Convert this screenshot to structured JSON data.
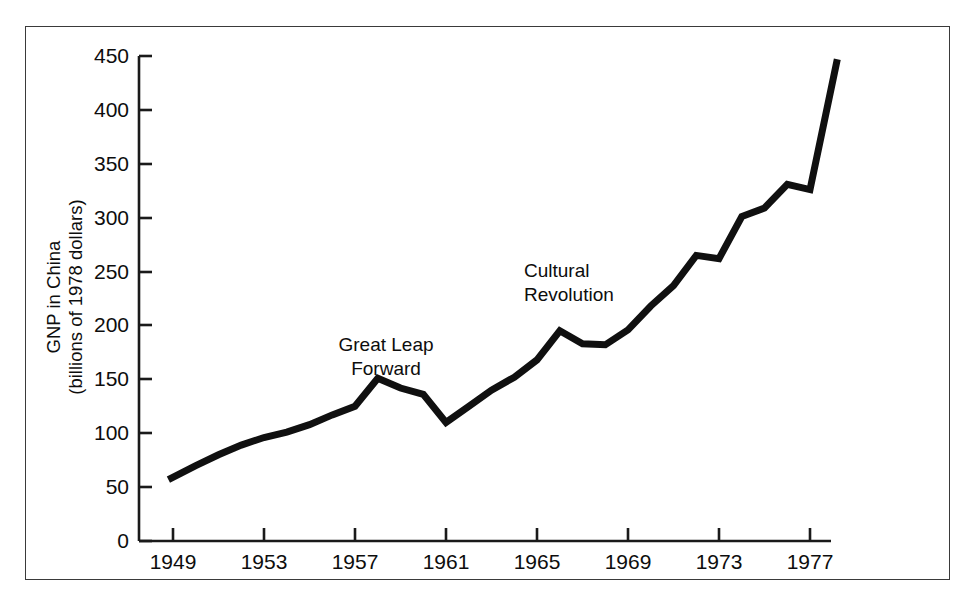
{
  "chart_data": {
    "type": "line",
    "title": "",
    "xlabel": "",
    "ylabel": "GNP in China\n(billions of 1978 dollars)",
    "ylabel_line1": "GNP in China",
    "ylabel_line2": "(billions of 1978 dollars)",
    "xlim": [
      1948.3,
      1978.6
    ],
    "ylim": [
      0,
      460
    ],
    "grid": false,
    "legend": false,
    "line_color": "#101010",
    "line_width_px": 7,
    "x_ticks": [
      1949,
      1953,
      1957,
      1961,
      1965,
      1969,
      1973,
      1977
    ],
    "x_tick_labels": [
      "1949",
      "1953",
      "1957",
      "1961",
      "1965",
      "1969",
      "1973",
      "1977"
    ],
    "y_ticks": [
      0,
      50,
      100,
      150,
      200,
      250,
      300,
      350,
      400,
      450
    ],
    "y_tick_labels": [
      "0",
      "50",
      "100",
      "150",
      "200",
      "250",
      "300",
      "350",
      "400",
      "450"
    ],
    "x": [
      1948.8,
      1950,
      1951,
      1952,
      1953,
      1954,
      1955,
      1956,
      1957,
      1958,
      1959,
      1960,
      1961,
      1962,
      1963,
      1964,
      1965,
      1966,
      1967,
      1968,
      1969,
      1970,
      1971,
      1972,
      1973,
      1974,
      1975,
      1976,
      1977,
      1978.2
    ],
    "values": [
      57,
      70,
      80,
      89,
      96,
      101,
      108,
      117,
      125,
      151,
      142,
      136,
      110,
      125,
      140,
      152,
      168,
      195,
      183,
      182,
      196,
      218,
      237,
      265,
      262,
      301,
      309,
      331,
      326,
      447
    ],
    "series": [
      {
        "name": "GNP in China",
        "values": [
          57,
          70,
          80,
          89,
          96,
          101,
          108,
          117,
          125,
          151,
          142,
          136,
          110,
          125,
          140,
          152,
          168,
          195,
          183,
          182,
          196,
          218,
          237,
          265,
          262,
          301,
          309,
          331,
          326,
          447
        ]
      }
    ],
    "annotations": [
      {
        "id": "great-leap-forward",
        "line1": "Great Leap",
        "line2": "Forward",
        "x": 1957.5,
        "y": 205
      },
      {
        "id": "cultural-revolution",
        "line1": "Cultural",
        "line2": "Revolution",
        "x": 1963.6,
        "y": 290
      }
    ]
  }
}
